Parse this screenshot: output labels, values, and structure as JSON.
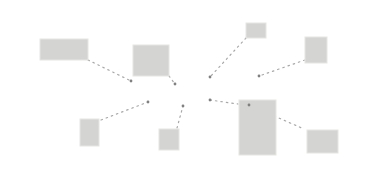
{
  "diagram": {
    "background": "#ffffff",
    "box_color": "#d4d4d2",
    "link_color": "#a8a8a8",
    "node_color": "#808080",
    "boxes": [
      {
        "id": "box-1",
        "x": 40,
        "y": 39,
        "w": 48,
        "h": 21
      },
      {
        "id": "box-2",
        "x": 133,
        "y": 45,
        "w": 36,
        "h": 31
      },
      {
        "id": "box-3",
        "x": 246,
        "y": 23,
        "w": 20,
        "h": 15
      },
      {
        "id": "box-4",
        "x": 305,
        "y": 37,
        "w": 22,
        "h": 26
      },
      {
        "id": "box-5",
        "x": 80,
        "y": 119,
        "w": 19,
        "h": 27
      },
      {
        "id": "box-6",
        "x": 159,
        "y": 129,
        "w": 20,
        "h": 21
      },
      {
        "id": "box-7",
        "x": 239,
        "y": 100,
        "w": 37,
        "h": 55
      },
      {
        "id": "box-8",
        "x": 307,
        "y": 130,
        "w": 31,
        "h": 23
      }
    ],
    "nodes": [
      {
        "id": "node-1",
        "x": 131,
        "y": 81
      },
      {
        "id": "node-2",
        "x": 175,
        "y": 84
      },
      {
        "id": "node-3",
        "x": 210,
        "y": 77
      },
      {
        "id": "node-4",
        "x": 259,
        "y": 76
      },
      {
        "id": "node-5",
        "x": 148,
        "y": 102
      },
      {
        "id": "node-6",
        "x": 183,
        "y": 106
      },
      {
        "id": "node-7",
        "x": 210,
        "y": 100
      },
      {
        "id": "node-8",
        "x": 249,
        "y": 105
      }
    ],
    "links": [
      {
        "id": "link-1",
        "x1": 88,
        "y1": 60,
        "x2": 131,
        "y2": 81
      },
      {
        "id": "link-2",
        "x1": 169,
        "y1": 76,
        "x2": 175,
        "y2": 84
      },
      {
        "id": "link-3",
        "x1": 246,
        "y1": 38,
        "x2": 210,
        "y2": 77
      },
      {
        "id": "link-4",
        "x1": 305,
        "y1": 60,
        "x2": 259,
        "y2": 76
      },
      {
        "id": "link-5",
        "x1": 101,
        "y1": 120,
        "x2": 148,
        "y2": 102
      },
      {
        "id": "link-6",
        "x1": 177,
        "y1": 128,
        "x2": 183,
        "y2": 106
      },
      {
        "id": "link-7",
        "x1": 210,
        "y1": 100,
        "x2": 238,
        "y2": 104
      },
      {
        "id": "link-8",
        "x1": 249,
        "y1": 105,
        "x2": 304,
        "y2": 129
      }
    ]
  }
}
